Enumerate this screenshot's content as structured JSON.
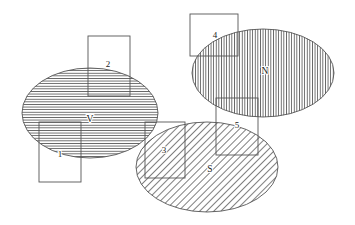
{
  "diagram": {
    "type": "venn-overlap-diagram",
    "background_color": "#ffffff",
    "stroke_color": "#555555",
    "label_color": "#1a1a1a",
    "ellipses": [
      {
        "id": "V",
        "label": "V",
        "hatch": "horizontal",
        "cx": 90,
        "cy": 113,
        "rx": 68,
        "ry": 45,
        "label_x": 90,
        "label_y": 120
      },
      {
        "id": "N",
        "label": "N",
        "hatch": "vertical",
        "cx": 263,
        "cy": 73,
        "rx": 71,
        "ry": 44,
        "label_x": 265,
        "label_y": 72
      },
      {
        "id": "S",
        "label": "S",
        "hatch": "diagonal",
        "cx": 207,
        "cy": 167,
        "rx": 71,
        "ry": 45,
        "label_x": 210,
        "label_y": 170
      }
    ],
    "rectangles": [
      {
        "id": "1",
        "label": "1",
        "x": 39,
        "y": 122,
        "width": 42,
        "height": 60,
        "label_x": 60,
        "label_y": 155
      },
      {
        "id": "2",
        "label": "2",
        "x": 88,
        "y": 36,
        "width": 42,
        "height": 60,
        "label_x": 108,
        "label_y": 65
      },
      {
        "id": "3",
        "label": "3",
        "x": 145,
        "y": 122,
        "width": 40,
        "height": 56,
        "label_x": 164,
        "label_y": 151
      },
      {
        "id": "4",
        "label": "4",
        "x": 190,
        "y": 14,
        "width": 48,
        "height": 42,
        "label_x": 215,
        "label_y": 36
      },
      {
        "id": "5",
        "label": "5",
        "x": 216,
        "y": 98,
        "width": 42,
        "height": 57,
        "label_x": 237,
        "label_y": 126
      }
    ]
  }
}
